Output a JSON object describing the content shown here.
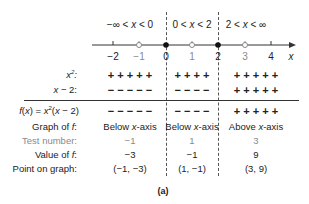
{
  "intervals": [
    {
      "label": "−∞ < x < 0",
      "center": 130
    },
    {
      "label": "0 < x < 2",
      "center": 192
    },
    {
      "label": "2 < x < ∞",
      "center": 246
    }
  ],
  "number_line": {
    "axis_label": "x",
    "ticks": [
      {
        "value": "−2",
        "x": 113,
        "type": "tick",
        "muted": false
      },
      {
        "value": "−1",
        "x": 139,
        "type": "open",
        "muted": true
      },
      {
        "value": "0",
        "x": 166,
        "type": "filled",
        "muted": false
      },
      {
        "value": "1",
        "x": 192,
        "type": "open",
        "muted": true
      },
      {
        "value": "2",
        "x": 218,
        "type": "filled",
        "muted": false
      },
      {
        "value": "3",
        "x": 245,
        "type": "open",
        "muted": true
      },
      {
        "value": "4",
        "x": 271,
        "type": "tick",
        "muted": false
      }
    ]
  },
  "rows": {
    "x2": {
      "label": "x²:",
      "signs": [
        "+ + + + +",
        "+ + + +",
        "+ + + + +"
      ]
    },
    "xminus2": {
      "label": "x − 2:",
      "signs": [
        "− − − − −",
        "− − − −",
        "+ + + + +"
      ]
    },
    "f": {
      "label": "f(x) = x²(x − 2)",
      "signs": [
        "− − − − −",
        "− − − −",
        "+ + + + +"
      ]
    },
    "graph": {
      "label": "Graph of f:",
      "values": [
        "Below x-axis",
        "Below x-axis",
        "Above x-axis"
      ]
    },
    "test": {
      "label": "Test number:",
      "values": [
        "−1",
        "1",
        "3"
      ]
    },
    "value": {
      "label": "Value of f:",
      "values": [
        "−3",
        "−1",
        "9"
      ]
    },
    "point": {
      "label": "Point on graph:",
      "values": [
        "(−1, −3)",
        "(1, −1)",
        "(3, 9)"
      ]
    }
  },
  "caption": "(a)"
}
